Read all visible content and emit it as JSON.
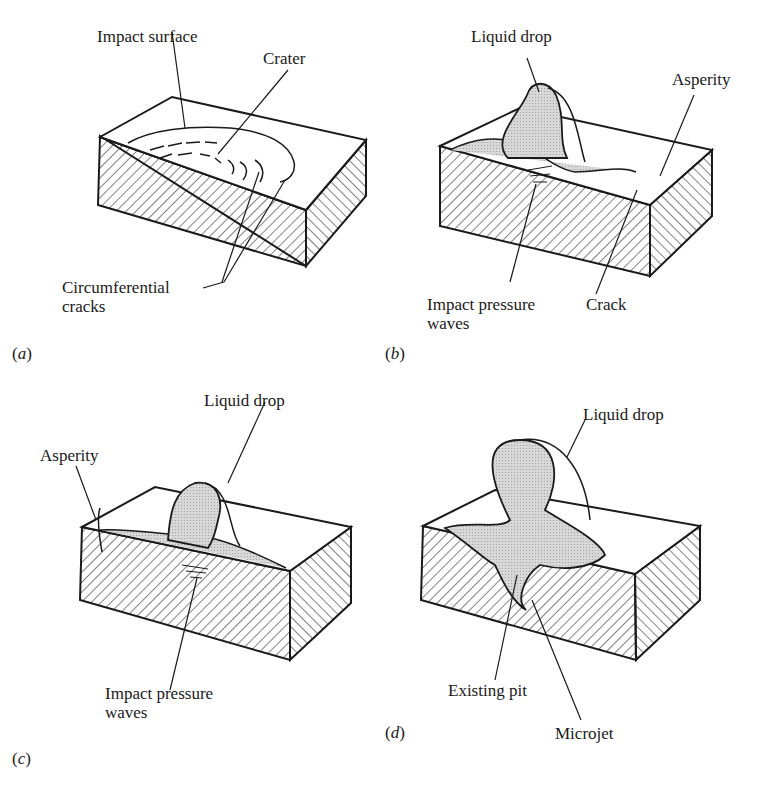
{
  "figure": {
    "panels": [
      {
        "id": "a",
        "caption": "(a)",
        "caption_letter": "a",
        "labels": {
          "impact_surface": "Impact surface",
          "crater": "Crater",
          "circumferential_cracks_line1": "Circumferential",
          "circumferential_cracks_line2": "cracks"
        }
      },
      {
        "id": "b",
        "caption": "(b)",
        "caption_letter": "b",
        "labels": {
          "liquid_drop": "Liquid drop",
          "asperity": "Asperity",
          "impact_pressure_waves_line1": "Impact pressure",
          "impact_pressure_waves_line2": "waves",
          "crack": "Crack"
        }
      },
      {
        "id": "c",
        "caption": "(c)",
        "caption_letter": "c",
        "labels": {
          "liquid_drop": "Liquid drop",
          "asperity": "Asperity",
          "impact_pressure_waves_line1": "Impact pressure",
          "impact_pressure_waves_line2": "waves"
        }
      },
      {
        "id": "d",
        "caption": "(d)",
        "caption_letter": "d",
        "labels": {
          "liquid_drop": "Liquid drop",
          "existing_pit": "Existing pit",
          "microjet": "Microjet"
        }
      }
    ],
    "colors": {
      "ink": "#1a1a1a",
      "drop_fill": "#cfcfcf",
      "background": "#ffffff"
    }
  }
}
